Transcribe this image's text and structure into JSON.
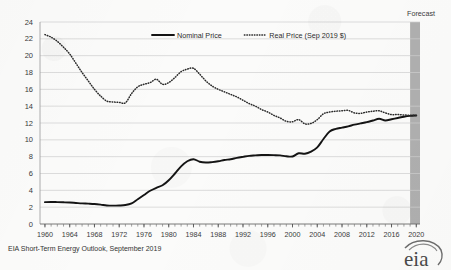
{
  "figure": {
    "source_note": "EIA Short-Term Energy Outlook, September 2019",
    "logo_text": "eia",
    "logo_icon": "eia-swoosh-logo",
    "forecast_label": "Forecast",
    "forecast_start_year": 2019.0,
    "forecast_end_year": 2020.6,
    "background_color": "#fbfbfa",
    "gridline_color": "#cfcfcf",
    "series_color": "#1a1a1a"
  },
  "chart_data": {
    "type": "line",
    "title": "",
    "subtitle": "",
    "xlabel": "",
    "ylabel": "",
    "xlim": [
      1959.2,
      2020.6
    ],
    "ylim": [
      0,
      24
    ],
    "ytick_step": 2,
    "grid": true,
    "legend_position": "top-center",
    "y_ticks": [
      0,
      2,
      4,
      6,
      8,
      10,
      12,
      14,
      16,
      18,
      20,
      22,
      24
    ],
    "x_ticks": [
      1960,
      1964,
      1968,
      1972,
      1976,
      1980,
      1984,
      1988,
      1992,
      1996,
      2000,
      2004,
      2008,
      2012,
      2016,
      2020
    ],
    "x_minor_tick_step": 1,
    "series": [
      {
        "name": "Nominal Price",
        "style": "solid",
        "color": "#141414",
        "x": [
          1960,
          1961,
          1962,
          1963,
          1964,
          1965,
          1966,
          1967,
          1968,
          1969,
          1970,
          1971,
          1972,
          1973,
          1974,
          1975,
          1976,
          1977,
          1978,
          1979,
          1980,
          1981,
          1982,
          1983,
          1984,
          1985,
          1986,
          1987,
          1988,
          1989,
          1990,
          1991,
          1992,
          1993,
          1994,
          1995,
          1996,
          1997,
          1998,
          1999,
          2000,
          2001,
          2002,
          2003,
          2004,
          2005,
          2006,
          2007,
          2008,
          2009,
          2010,
          2011,
          2012,
          2013,
          2014,
          2015,
          2016,
          2017,
          2018,
          2019,
          2020
        ],
        "values": [
          2.6,
          2.62,
          2.6,
          2.58,
          2.55,
          2.5,
          2.45,
          2.42,
          2.38,
          2.3,
          2.2,
          2.18,
          2.2,
          2.25,
          2.45,
          2.95,
          3.45,
          3.95,
          4.3,
          4.6,
          5.2,
          6.0,
          6.85,
          7.45,
          7.7,
          7.4,
          7.3,
          7.35,
          7.45,
          7.6,
          7.7,
          7.85,
          7.98,
          8.1,
          8.15,
          8.2,
          8.2,
          8.18,
          8.15,
          8.05,
          8.02,
          8.4,
          8.35,
          8.6,
          9.1,
          10.1,
          11.0,
          11.3,
          11.45,
          11.6,
          11.8,
          11.95,
          12.1,
          12.3,
          12.5,
          12.3,
          12.45,
          12.6,
          12.75,
          12.85,
          12.9
        ]
      },
      {
        "name": "Real Price (Sep 2019 $)",
        "style": "dotted",
        "color": "#2a2a2a",
        "x": [
          1960,
          1961,
          1962,
          1963,
          1964,
          1965,
          1966,
          1967,
          1968,
          1969,
          1970,
          1971,
          1972,
          1973,
          1974,
          1975,
          1976,
          1977,
          1978,
          1979,
          1980,
          1981,
          1982,
          1983,
          1984,
          1985,
          1986,
          1987,
          1988,
          1989,
          1990,
          1991,
          1992,
          1993,
          1994,
          1995,
          1996,
          1997,
          1998,
          1999,
          2000,
          2001,
          2002,
          2003,
          2004,
          2005,
          2006,
          2007,
          2008,
          2009,
          2010,
          2011,
          2012,
          2013,
          2014,
          2015,
          2016,
          2017,
          2018,
          2019,
          2020
        ],
        "values": [
          22.5,
          22.2,
          21.7,
          21.0,
          20.2,
          19.1,
          18.0,
          17.0,
          16.0,
          15.2,
          14.6,
          14.5,
          14.45,
          14.4,
          15.5,
          16.3,
          16.6,
          16.8,
          17.2,
          16.6,
          16.8,
          17.4,
          18.1,
          18.4,
          18.5,
          17.8,
          17.0,
          16.4,
          16.0,
          15.7,
          15.4,
          15.1,
          14.7,
          14.3,
          14.0,
          13.6,
          13.3,
          12.9,
          12.6,
          12.2,
          12.15,
          12.4,
          11.9,
          11.95,
          12.4,
          13.1,
          13.3,
          13.4,
          13.45,
          13.5,
          13.2,
          13.15,
          13.3,
          13.4,
          13.45,
          13.2,
          13.0,
          13.0,
          12.95,
          12.92,
          12.9
        ]
      }
    ]
  }
}
